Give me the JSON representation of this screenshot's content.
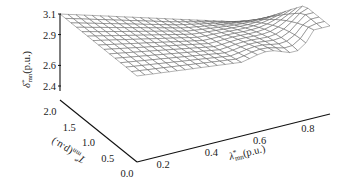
{
  "chart_data": {
    "type": "surface3d",
    "title": "",
    "zlabel": {
      "base": "δ",
      "sup": "*",
      "sub": "mn",
      "unit": "(p.u.)"
    },
    "xlabel": {
      "base": "λ",
      "sup": "*",
      "sub": "mn",
      "unit": "(p.u.)"
    },
    "ylabel": {
      "base": "T",
      "sup": "*",
      "sub": "mn",
      "unit": "(p.u.)"
    },
    "z_ticks": [
      "3.1",
      "2.9",
      "2.6",
      "2.4"
    ],
    "z_tick_values": [
      3.1,
      2.9,
      2.6,
      2.4
    ],
    "zlim": [
      2.3,
      3.15
    ],
    "x_ticks": [
      "0.2",
      "0.4",
      "0.6",
      "0.8"
    ],
    "x_tick_values": [
      0.2,
      0.4,
      0.6,
      0.8
    ],
    "xlim": [
      0.1,
      0.9
    ],
    "y_ticks": [
      "0.0",
      "0.5",
      "1.0",
      "1.5",
      "2.0"
    ],
    "y_tick_values": [
      0.0,
      0.5,
      1.0,
      1.5,
      2.0
    ],
    "ylim": [
      0.0,
      2.0
    ],
    "x": [
      0.1,
      0.2,
      0.3,
      0.4,
      0.5,
      0.6,
      0.7,
      0.8,
      0.9
    ],
    "y": [
      0.0,
      0.25,
      0.5,
      0.75,
      1.0,
      1.25,
      1.5,
      1.75,
      2.0
    ],
    "z_description": "Surface falls from ~3.1 at low lambda / high T toward ~2.55 along a valley, then rises again near lambda 0.9 with a curled edge at low T",
    "grid": false
  }
}
